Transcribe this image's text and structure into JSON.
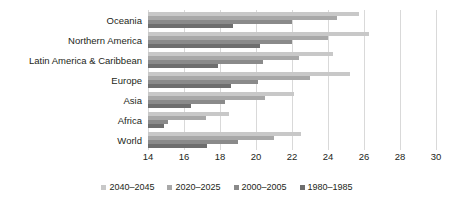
{
  "chart_data": {
    "type": "bar",
    "orientation": "horizontal",
    "title": "",
    "subtitle": "",
    "xlabel": "",
    "ylabel": "",
    "xlim": [
      14,
      30
    ],
    "xticks": [
      14,
      16,
      18,
      20,
      22,
      24,
      26,
      28,
      30
    ],
    "xtick_labels": [
      "14",
      "16",
      "18",
      "20",
      "22",
      "24",
      "26",
      "28",
      "30"
    ],
    "grid": true,
    "grid_axis": "x",
    "legend_position": "bottom",
    "categories": [
      "Oceania",
      "Northern America",
      "Latin America & Caribbean",
      "Europe",
      "Asia",
      "Africa",
      "World"
    ],
    "series": [
      {
        "name": "2040–2045",
        "color": "#c8c8c8",
        "values": [
          25.7,
          26.3,
          24.3,
          25.2,
          22.1,
          18.5,
          22.5
        ]
      },
      {
        "name": "2020–2025",
        "color": "#a8a8a8",
        "values": [
          24.5,
          24.0,
          22.4,
          23.0,
          20.5,
          17.2,
          21.0
        ]
      },
      {
        "name": "2000–2005",
        "color": "#8a8a8a",
        "values": [
          22.0,
          22.0,
          20.4,
          20.1,
          18.3,
          15.1,
          19.0
        ]
      },
      {
        "name": "1980–1985",
        "color": "#6e6e6e",
        "values": [
          18.7,
          20.2,
          17.9,
          18.6,
          16.4,
          14.9,
          17.3
        ]
      }
    ]
  },
  "legend": {
    "items": [
      {
        "label": "2040–2045",
        "color": "#c8c8c8"
      },
      {
        "label": "2020–2025",
        "color": "#a8a8a8"
      },
      {
        "label": "2000–2005",
        "color": "#8a8a8a"
      },
      {
        "label": "1980–1985",
        "color": "#6e6e6e"
      }
    ]
  },
  "colors": {
    "gridline": "#d9d9d9",
    "text": "#231f20",
    "background": "#ffffff"
  }
}
